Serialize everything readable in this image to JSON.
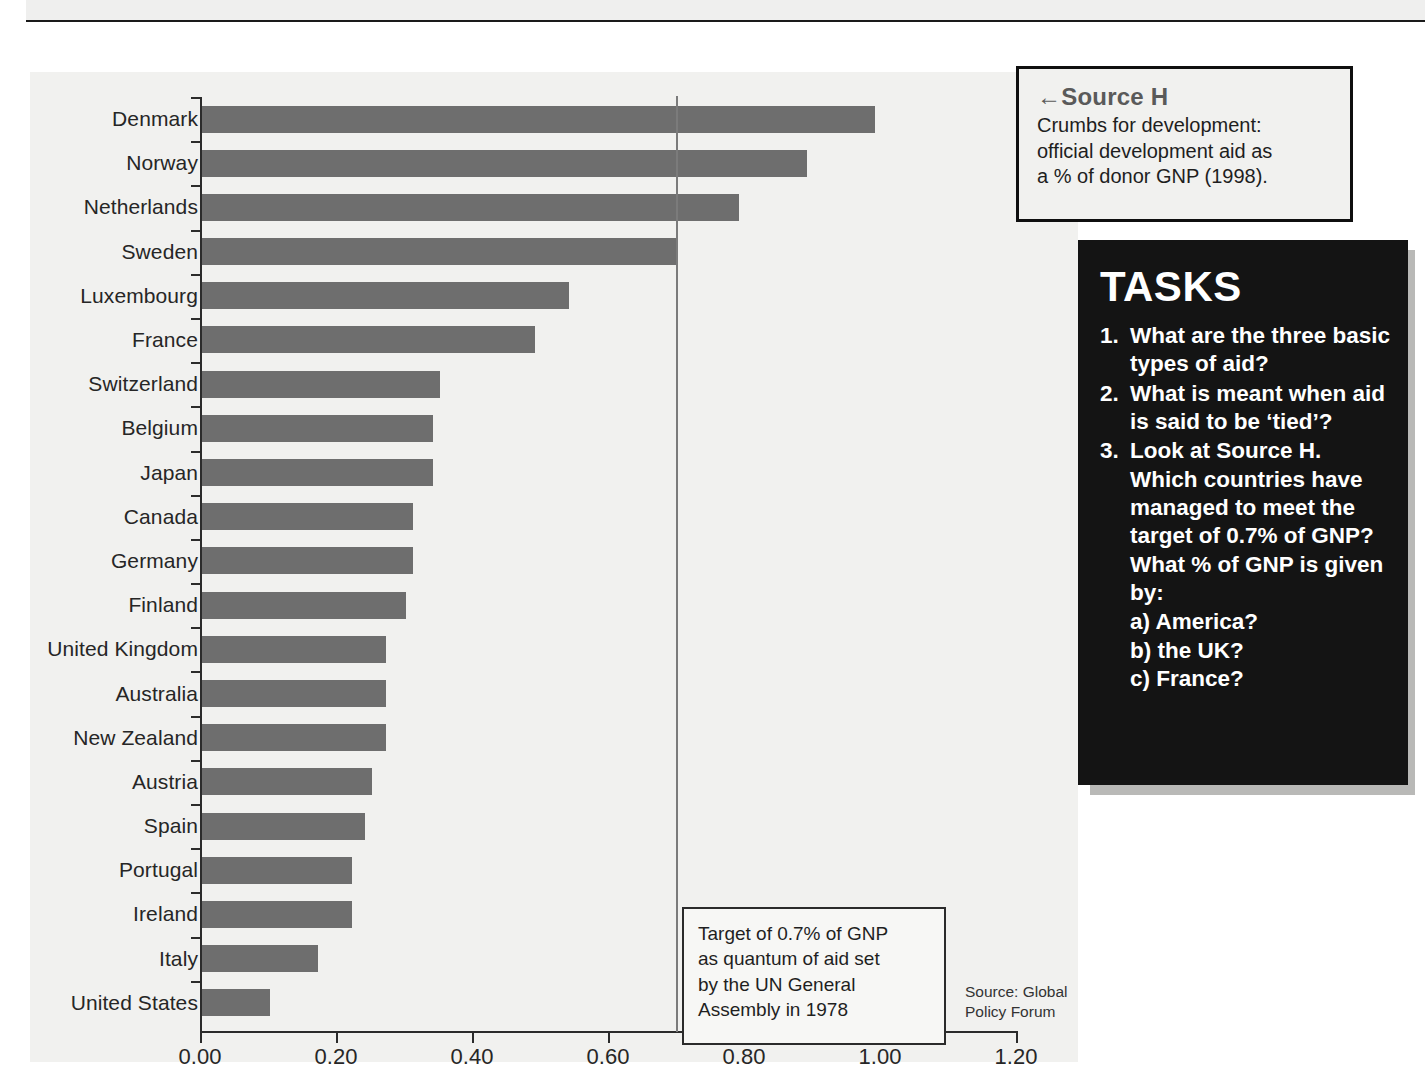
{
  "page": {
    "top_strip_text": ""
  },
  "chart_data": {
    "type": "bar",
    "orientation": "horizontal",
    "title": "Crumbs for development: official development aid as a % of donor GNP (1998).",
    "xlabel": "",
    "ylabel": "",
    "xlim": [
      0.0,
      1.2
    ],
    "xticks": [
      "0.00",
      "0.20",
      "0.40",
      "0.60",
      "0.80",
      "1.00",
      "1.20"
    ],
    "xtick_values": [
      0.0,
      0.2,
      0.4,
      0.6,
      0.8,
      1.0,
      1.2
    ],
    "grid": false,
    "legend": "none",
    "bar_color": "#6e6e6e",
    "plot_background": "#f1f1ef",
    "reference_line": {
      "value": 0.7,
      "color": "#7b7b7b",
      "label": "Target of 0.7% of GNP as quantum of aid set by the UN General Assembly in 1978"
    },
    "categories": [
      "Denmark",
      "Norway",
      "Netherlands",
      "Sweden",
      "Luxembourg",
      "France",
      "Switzerland",
      "Belgium",
      "Japan",
      "Canada",
      "Germany",
      "Finland",
      "United Kingdom",
      "Australia",
      "New Zealand",
      "Austria",
      "Spain",
      "Portugal",
      "Ireland",
      "Italy",
      "United States"
    ],
    "values": [
      0.99,
      0.89,
      0.79,
      0.7,
      0.54,
      0.49,
      0.35,
      0.34,
      0.34,
      0.31,
      0.31,
      0.3,
      0.27,
      0.27,
      0.27,
      0.25,
      0.24,
      0.22,
      0.22,
      0.17,
      0.1
    ],
    "source": "Source: Global Policy Forum"
  },
  "target_callout": {
    "line1": "Target of 0.7% of GNP",
    "line2": "as quantum of aid set",
    "line3": "by the UN General",
    "line4": "Assembly in 1978"
  },
  "source_credit": {
    "line1": "Source: Global",
    "line2": "Policy Forum"
  },
  "source_h": {
    "arrow": "←",
    "title": "Source H",
    "body_line1": "Crumbs for development:",
    "body_line2": "official development aid as",
    "body_line3": "a % of donor GNP (1998)."
  },
  "tasks": {
    "title": "TASKS",
    "items": [
      {
        "num": "1.",
        "text": "What are the three basic types of aid?"
      },
      {
        "num": "2.",
        "text": "What is meant when aid is said to be ‘tied’?"
      },
      {
        "num": "3.",
        "text": "Look at Source H. Which countries have managed to meet the target of 0.7% of GNP? What % of GNP is given by:"
      }
    ],
    "subitems": [
      "a) America?",
      "b) the UK?",
      "c) France?"
    ]
  },
  "colors": {
    "bar": "#6e6e6e",
    "panel_bg": "#f1f1ef",
    "tasks_bg": "#141414",
    "axis": "#2b2b2b",
    "target_line": "#7b7b7b"
  }
}
